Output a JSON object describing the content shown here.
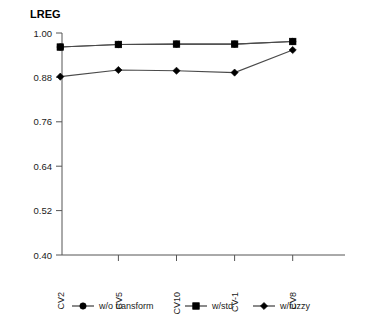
{
  "chart_data": {
    "type": "line",
    "title": "LREG",
    "xlabel": "",
    "ylabel": "",
    "categories": [
      "CV2",
      "CV5",
      "CV10",
      "CV-1",
      "CV8"
    ],
    "ylim": [
      0.4,
      1.0
    ],
    "yticks": [
      "1.00",
      "0.88",
      "0.76",
      "0.64",
      "0.52",
      "0.40"
    ],
    "ytick_values": [
      1.0,
      0.88,
      0.76,
      0.64,
      0.52,
      0.4
    ],
    "grid": false,
    "legend_position": "bottom",
    "series": [
      {
        "name": "w/o transform",
        "marker": "circle",
        "color": "#000000",
        "values": [
          0.962,
          0.969,
          0.97,
          0.97,
          0.977
        ]
      },
      {
        "name": "w/std",
        "marker": "square",
        "color": "#000000",
        "values": [
          0.962,
          0.969,
          0.97,
          0.97,
          0.977
        ]
      },
      {
        "name": "w/fuzzy",
        "marker": "diamond",
        "color": "#000000",
        "values": [
          0.882,
          0.9,
          0.898,
          0.893,
          0.954
        ]
      }
    ]
  },
  "legend": {
    "items": [
      {
        "label": "w/o transform",
        "marker": "circle"
      },
      {
        "label": "w/std",
        "marker": "square"
      },
      {
        "label": "w/fuzzy",
        "marker": "diamond"
      }
    ]
  }
}
